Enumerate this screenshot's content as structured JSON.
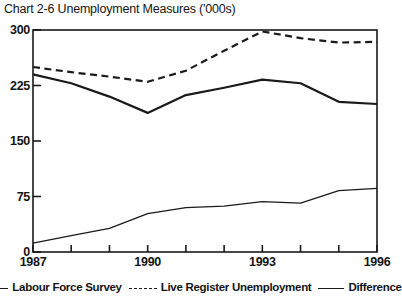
{
  "chart_data": {
    "type": "line",
    "title": "Chart 2-6 Unemployment Measures ('000s)",
    "xlabel": "",
    "ylabel": "",
    "x": [
      1987,
      1988,
      1989,
      1990,
      1991,
      1992,
      1993,
      1994,
      1995,
      1996
    ],
    "xtick_labels": [
      "1987",
      "1990",
      "1993",
      "1996"
    ],
    "xtick_values": [
      1987,
      1990,
      1993,
      1996
    ],
    "xlim": [
      1987,
      1996
    ],
    "ytick_labels": [
      "0",
      "75",
      "150",
      "225",
      "300"
    ],
    "ytick_values": [
      0,
      75,
      150,
      225,
      300
    ],
    "ylim": [
      0,
      300
    ],
    "grid": false,
    "legend_position": "bottom",
    "series": [
      {
        "name": "Labour Force Survey",
        "style": "solid",
        "width": 2.2,
        "color": "#1a1a1a",
        "values": [
          240,
          228,
          210,
          188,
          212,
          222,
          233,
          228,
          203,
          200
        ]
      },
      {
        "name": "Live Register Unemployment",
        "style": "dashed",
        "width": 2.2,
        "color": "#1a1a1a",
        "values": [
          250,
          243,
          237,
          230,
          245,
          272,
          298,
          289,
          283,
          284
        ]
      },
      {
        "name": "Difference",
        "style": "solid",
        "width": 1.3,
        "color": "#1a1a1a",
        "values": [
          12,
          22,
          32,
          52,
          60,
          62,
          68,
          66,
          83,
          86
        ]
      }
    ]
  },
  "axis": {
    "border_color": "#1a1a1a"
  }
}
